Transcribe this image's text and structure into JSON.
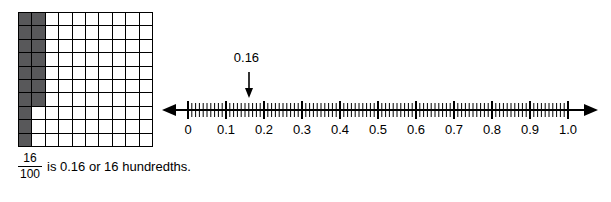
{
  "grid": {
    "name": "hundredths-grid",
    "rows": 10,
    "cols": 10,
    "shaded_count": 16,
    "shaded_color": "#58585a",
    "shaded_cells": [
      [
        0,
        0
      ],
      [
        0,
        1
      ],
      [
        1,
        0
      ],
      [
        1,
        1
      ],
      [
        2,
        0
      ],
      [
        2,
        1
      ],
      [
        3,
        0
      ],
      [
        3,
        1
      ],
      [
        4,
        0
      ],
      [
        4,
        1
      ],
      [
        5,
        0
      ],
      [
        5,
        1
      ],
      [
        6,
        0
      ],
      [
        6,
        1
      ],
      [
        7,
        0
      ],
      [
        8,
        0
      ],
      [
        9,
        0
      ]
    ]
  },
  "caption": {
    "numerator": "16",
    "denominator": "100",
    "text": "is 0.16 or 16 hundredths."
  },
  "chart_data": {
    "type": "line",
    "title": "",
    "xlabel": "",
    "ylabel": "",
    "xlim": [
      0,
      1.0
    ],
    "tick_labels": [
      "0",
      "0.1",
      "0.2",
      "0.3",
      "0.4",
      "0.5",
      "0.6",
      "0.7",
      "0.8",
      "0.9",
      "1.0"
    ],
    "minor_ticks_per_interval": 10,
    "annotation": {
      "label": "0.16",
      "value": 0.16
    },
    "arrows": [
      "left",
      "right"
    ]
  },
  "colors": {
    "line": "#000000",
    "shaded": "#58585a",
    "background": "#ffffff"
  }
}
